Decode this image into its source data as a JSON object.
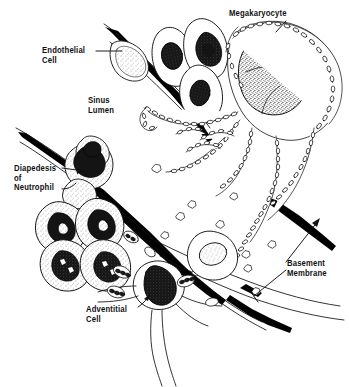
{
  "figure": {
    "background_color": "#ffffff",
    "ink_color": "#111111",
    "width": 349,
    "height": 387
  },
  "labels": {
    "endothelial": "Endothelial\nCell",
    "sinus": "Sinus\nLumen",
    "diapedesis": "Diapedesis\nof\nNeutrophil",
    "adventitial": "Adventitial\nCell",
    "basement": "Basement\nMembrane",
    "megakaryocyte": "Megakaryocyte"
  },
  "structures": [
    {
      "name": "megakaryocyte",
      "description": "large cell with multilobed stippled nucleus and beaded cytoplasmic processes"
    },
    {
      "name": "endothelial-cell",
      "description": "flattened cell with pale stippled elongated nucleus lining the sinus"
    },
    {
      "name": "basement-membrane",
      "description": "thick black band beneath the endothelium"
    },
    {
      "name": "neutrophil-diapedesis",
      "description": "neutrophil squeezing through a gap in the sinus wall"
    },
    {
      "name": "granulocyte-cluster",
      "description": "cluster of granulocytes with lobed dark nuclei"
    },
    {
      "name": "adventitial-cell",
      "description": "cell with dark triangular nucleus and branching processes"
    },
    {
      "name": "platelets",
      "description": "small angular star-shaped platelets shed into the sinus lumen"
    }
  ]
}
